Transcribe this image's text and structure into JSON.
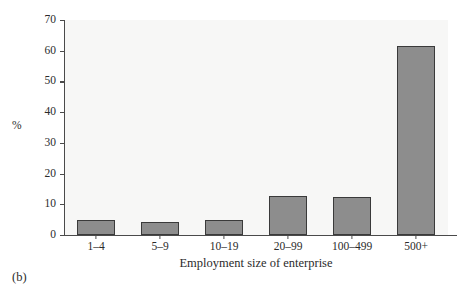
{
  "figure": {
    "caption": "(b)",
    "background": "#ffffff",
    "plot_background": "#f7f7f6",
    "bar_fill": "#8d8d8d",
    "bar_stroke": "#3a3a3a",
    "axis_color": "#4a4a4a"
  },
  "chart_data": {
    "type": "bar",
    "title": "",
    "categories": [
      "1–4",
      "5–9",
      "10–19",
      "20–99",
      "100–499",
      "500+"
    ],
    "values": [
      4.8,
      4.2,
      4.9,
      12.6,
      12.3,
      61.5
    ],
    "xlabel": "Employment size of enterprise",
    "ylabel": "%",
    "ylim": [
      0,
      70
    ],
    "yticks": [
      0,
      10,
      20,
      30,
      40,
      50,
      60,
      70
    ],
    "ytick_labels": [
      "0",
      "10",
      "20",
      "30",
      "40",
      "50",
      "60",
      "70"
    ],
    "grid": false,
    "legend": null
  }
}
